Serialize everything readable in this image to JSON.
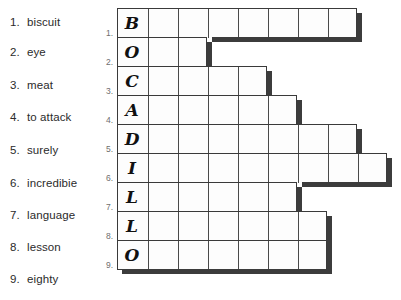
{
  "clues": {
    "title": "word-clue-list",
    "items": [
      {
        "num": "1.",
        "word": "biscuit"
      },
      {
        "num": "2.",
        "word": "eye"
      },
      {
        "num": "3.",
        "word": "meat"
      },
      {
        "num": "4.",
        "word": "to attack"
      },
      {
        "num": "5.",
        "word": "surely"
      },
      {
        "num": "6.",
        "word": "incredibie"
      },
      {
        "num": "7.",
        "word": "language"
      },
      {
        "num": "8.",
        "word": "lesson"
      },
      {
        "num": "9.",
        "word": "eighty"
      }
    ]
  },
  "grid": {
    "row_numbers": [
      "1.",
      "2.",
      "3.",
      "4.",
      "5.",
      "6.",
      "7.",
      "8.",
      "9."
    ],
    "row_lengths": [
      8,
      3,
      5,
      6,
      8,
      9,
      6,
      7,
      7
    ],
    "filled_column_letters": [
      "B",
      "O",
      "C",
      "A",
      "D",
      "I",
      "L",
      "L",
      "O"
    ],
    "cell_width": 30,
    "cell_height": 29,
    "colors": {
      "border": "#3a3a3a",
      "shadow": "#3c3c3c",
      "cell_fill": "#fdfdfd",
      "row_number": "#6e6e6e"
    }
  }
}
